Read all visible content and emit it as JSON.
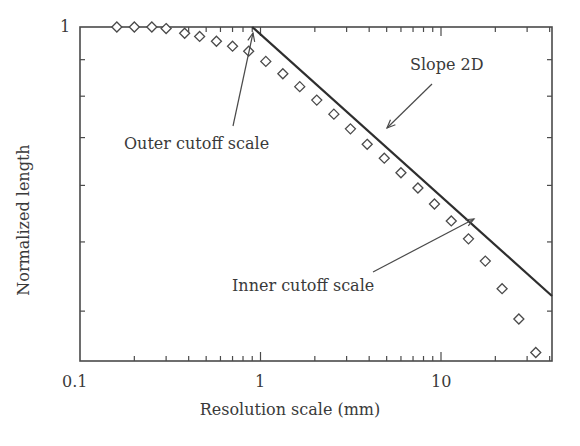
{
  "chart_data": {
    "type": "scatter",
    "title": "",
    "xlabel": "Resolution scale (mm)",
    "ylabel": "Normalized length",
    "xscale": "log",
    "yscale": "log",
    "xlim": [
      0.1,
      40
    ],
    "ylim": [
      0.3,
      1
    ],
    "x_tick_labels": [
      "0.1",
      "1",
      "10"
    ],
    "y_tick_labels": [
      "1"
    ],
    "grid": false,
    "legend": null,
    "series": [
      {
        "name": "Measured data",
        "marker": "diamond-open",
        "x": [
          0.16,
          0.2,
          0.25,
          0.3,
          0.38,
          0.46,
          0.57,
          0.7,
          0.86,
          1.07,
          1.33,
          1.65,
          2.05,
          2.55,
          3.15,
          3.9,
          4.85,
          6.0,
          7.45,
          9.2,
          11.4,
          14.2,
          17.6,
          21.8,
          27.0,
          33.5
        ],
        "y": [
          1.0,
          1.0,
          1.0,
          0.995,
          0.98,
          0.97,
          0.955,
          0.94,
          0.925,
          0.895,
          0.86,
          0.825,
          0.79,
          0.755,
          0.72,
          0.685,
          0.655,
          0.625,
          0.595,
          0.565,
          0.535,
          0.505,
          0.47,
          0.43,
          0.39,
          0.35
        ]
      },
      {
        "name": "Slope 2D",
        "type": "line",
        "x": [
          0.9,
          40
        ],
        "y": [
          1.0,
          0.42
        ]
      }
    ],
    "annotations": [
      {
        "text": "Outer cutoff scale",
        "points_to": [
          0.9,
          1.0
        ]
      },
      {
        "text": "Slope 2D",
        "points_to": [
          4.3,
          0.71
        ]
      },
      {
        "text": "Inner cutoff scale",
        "points_to": [
          15.5,
          0.51
        ]
      }
    ]
  },
  "labels": {
    "ylabel": "Normalized length",
    "xlabel": "Resolution scale (mm)",
    "xtick_0": "0.1",
    "xtick_1": "1",
    "xtick_2": "10",
    "ytick_0": "1",
    "annot_outer": "Outer cutoff scale",
    "annot_slope": "Slope 2D",
    "annot_inner": "Inner cutoff scale"
  },
  "colors": {
    "axis": "#4a4a4a",
    "line": "#2e2e2e",
    "marker": "#4a4a4a",
    "text": "#3a3a3a"
  }
}
